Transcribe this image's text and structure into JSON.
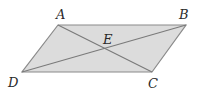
{
  "figure": {
    "shape": "parallelogram",
    "fill_color": "#dcdcdc",
    "stroke_color": "#8a8a8a",
    "vertices": {
      "A": {
        "label": "A",
        "x": 58,
        "y": 25
      },
      "B": {
        "label": "B",
        "x": 186,
        "y": 25
      },
      "C": {
        "label": "C",
        "x": 152,
        "y": 72
      },
      "D": {
        "label": "D",
        "x": 22,
        "y": 72
      }
    },
    "intersection": {
      "label": "E"
    },
    "diagonals": [
      "AC",
      "BD"
    ]
  }
}
